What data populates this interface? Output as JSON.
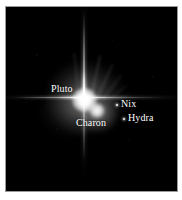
{
  "image": {
    "title": "Pluto system",
    "background_color": "#000000",
    "page_background": "#ffffff",
    "border_color": "#9a9a9a",
    "label_color": "#ffffff"
  },
  "annotations": {
    "pluto": {
      "label": "Pluto",
      "marker": "none"
    },
    "charon": {
      "label": "Charon",
      "marker": "none"
    },
    "nix": {
      "label": "Nix",
      "marker": "point-dot"
    },
    "hydra": {
      "label": "Hydra",
      "marker": "point-dot"
    }
  },
  "objects": [
    {
      "name": "Pluto",
      "kind": "bright-core",
      "x": 78,
      "y": 93,
      "relative_brightness": 100
    },
    {
      "name": "Charon",
      "kind": "bright-core",
      "x": 91,
      "y": 103,
      "relative_brightness": 55
    },
    {
      "name": "Nix",
      "kind": "faint-point",
      "x": 111,
      "y": 98,
      "relative_brightness": 6
    },
    {
      "name": "Hydra",
      "kind": "faint-point",
      "x": 118,
      "y": 112,
      "relative_brightness": 5
    }
  ],
  "features": {
    "diffraction_spikes": [
      "vertical",
      "horizontal"
    ],
    "scattered_light": "wispy streaks upper-right of Pluto"
  }
}
